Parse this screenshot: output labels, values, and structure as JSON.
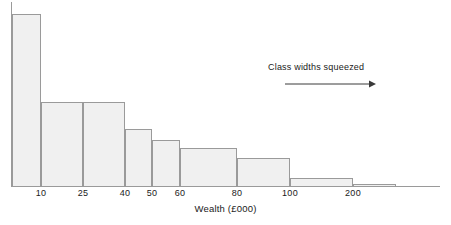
{
  "chart_data": {
    "type": "bar",
    "title": "",
    "subtitle": "",
    "xlabel": "Wealth (£000)",
    "ylabel": "",
    "grid": false,
    "legend": null,
    "note": "Histogram of wealth distribution with unequal (squeezed) class widths; bar heights are frequency densities.",
    "tick_labels": [
      "10",
      "25",
      "40",
      "50",
      "60",
      "80",
      "100",
      "200"
    ],
    "tick_values": [
      10,
      25,
      40,
      50,
      60,
      80,
      100,
      200
    ],
    "axis_start_label": "0",
    "bins": [
      {
        "label": "0-10",
        "lower": 0,
        "upper": 10,
        "x0": 12,
        "x1": 41,
        "top": 14,
        "height_px": 172,
        "density": 1.0
      },
      {
        "label": "10-25",
        "lower": 10,
        "upper": 25,
        "x0": 41,
        "x1": 83,
        "top": 102,
        "height_px": 84,
        "density": 0.49
      },
      {
        "label": "25-40",
        "lower": 25,
        "upper": 40,
        "x0": 83,
        "x1": 125,
        "top": 102,
        "height_px": 84,
        "density": 0.49
      },
      {
        "label": "40-50",
        "lower": 40,
        "upper": 50,
        "x0": 125,
        "x1": 152,
        "top": 129,
        "height_px": 57,
        "density": 0.33
      },
      {
        "label": "50-60",
        "lower": 50,
        "upper": 60,
        "x0": 152,
        "x1": 180,
        "top": 140,
        "height_px": 46,
        "density": 0.27
      },
      {
        "label": "60-80",
        "lower": 60,
        "upper": 80,
        "x0": 180,
        "x1": 237,
        "top": 148,
        "height_px": 38,
        "density": 0.22
      },
      {
        "label": "80-100",
        "lower": 80,
        "upper": 100,
        "x0": 237,
        "x1": 290,
        "top": 158,
        "height_px": 28,
        "density": 0.16
      },
      {
        "label": "100-200",
        "lower": 100,
        "upper": 200,
        "x0": 290,
        "x1": 353,
        "top": 178,
        "height_px": 8,
        "density": 0.05
      },
      {
        "label": "200+",
        "lower": 200,
        "upper": 300,
        "x0": 353,
        "x1": 396,
        "top": 184,
        "height_px": 2,
        "density": 0.01
      }
    ],
    "annotation": {
      "text": "Class widths squeezed",
      "arrow_direction": "right"
    }
  },
  "colors": {
    "bar_fill": "#f0f0f0",
    "bar_border": "#9a9a9a",
    "axis": "#9a9a9a",
    "text": "#1a1a1a",
    "background": "#ffffff"
  }
}
